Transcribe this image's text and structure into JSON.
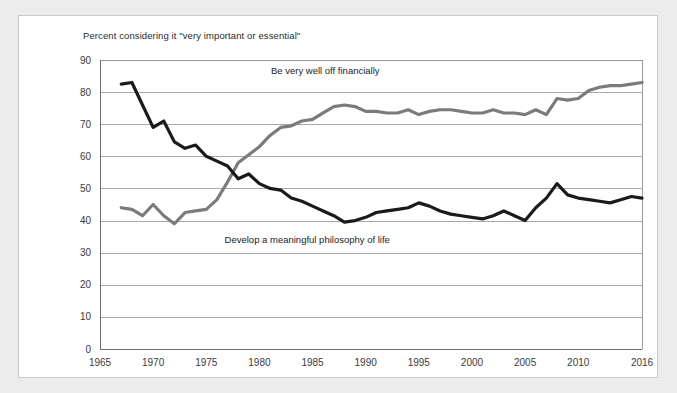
{
  "chart_data": {
    "type": "line",
    "title": "Percent considering it \"very important or essential\"",
    "xlabel": "",
    "ylabel": "",
    "xlim": [
      1965,
      2016
    ],
    "ylim": [
      0,
      90
    ],
    "ytick_labels": [
      "0",
      "10",
      "20",
      "30",
      "40",
      "50",
      "60",
      "70",
      "80",
      "90"
    ],
    "ytick_values": [
      0,
      10,
      20,
      30,
      40,
      50,
      60,
      70,
      80,
      90
    ],
    "xtick_labels": [
      "1965",
      "1970",
      "1975",
      "1980",
      "1985",
      "1990",
      "1995",
      "2000",
      "2005",
      "2010",
      "2016"
    ],
    "xtick_values": [
      1965,
      1970,
      1975,
      1980,
      1985,
      1990,
      1995,
      2000,
      2005,
      2010,
      2016
    ],
    "grid": "horizontal",
    "legend_position": "inline-annotation",
    "series": [
      {
        "name": "Be very well off financially",
        "color": "#7b7b7b",
        "annotation_x": 1986.2,
        "annotation_y": 85.5,
        "x": [
          1967,
          1968,
          1969,
          1970,
          1971,
          1972,
          1973,
          1974,
          1975,
          1976,
          1977,
          1978,
          1979,
          1980,
          1981,
          1982,
          1983,
          1984,
          1985,
          1986,
          1987,
          1988,
          1989,
          1990,
          1991,
          1992,
          1993,
          1994,
          1995,
          1996,
          1997,
          1998,
          1999,
          2000,
          2001,
          2002,
          2003,
          2004,
          2005,
          2006,
          2007,
          2008,
          2009,
          2010,
          2011,
          2012,
          2013,
          2014,
          2015,
          2016
        ],
        "y": [
          44.0,
          43.5,
          41.5,
          45.0,
          41.5,
          39.0,
          42.5,
          43.0,
          43.5,
          46.5,
          52.0,
          58.0,
          60.5,
          63.0,
          66.5,
          69.0,
          69.5,
          71.0,
          71.5,
          73.5,
          75.5,
          76.0,
          75.5,
          74.0,
          74.0,
          73.5,
          73.5,
          74.5,
          73.0,
          74.0,
          74.5,
          74.5,
          74.0,
          73.5,
          73.5,
          74.5,
          73.5,
          73.5,
          73.0,
          74.5,
          73.0,
          78.0,
          77.5,
          78.0,
          80.5,
          81.5,
          82.0,
          82.0,
          82.5,
          83.0
        ]
      },
      {
        "name": "Develop a meaningful philosophy of life",
        "color": "#1a1a1a",
        "annotation_x": 1984.5,
        "annotation_y": 33.0,
        "x": [
          1967,
          1968,
          1969,
          1970,
          1971,
          1972,
          1973,
          1974,
          1975,
          1976,
          1977,
          1978,
          1979,
          1980,
          1981,
          1982,
          1983,
          1984,
          1985,
          1986,
          1987,
          1988,
          1989,
          1990,
          1991,
          1992,
          1993,
          1994,
          1995,
          1996,
          1997,
          1998,
          1999,
          2000,
          2001,
          2002,
          2003,
          2004,
          2005,
          2006,
          2007,
          2008,
          2009,
          2010,
          2011,
          2012,
          2013,
          2014,
          2015,
          2016
        ],
        "y": [
          82.5,
          83.0,
          76.0,
          69.0,
          71.0,
          64.5,
          62.5,
          63.5,
          60.0,
          58.5,
          57.0,
          53.0,
          54.5,
          51.5,
          50.0,
          49.5,
          47.0,
          46.0,
          44.5,
          43.0,
          41.5,
          39.5,
          40.0,
          41.0,
          42.5,
          43.0,
          43.5,
          44.0,
          45.5,
          44.5,
          43.0,
          42.0,
          41.5,
          41.0,
          40.5,
          41.5,
          43.0,
          41.5,
          40.0,
          44.0,
          47.0,
          51.5,
          48.0,
          47.0,
          46.5,
          46.0,
          45.5,
          46.5,
          47.5,
          47.0
        ]
      }
    ]
  }
}
